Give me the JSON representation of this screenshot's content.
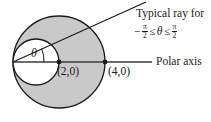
{
  "figure": {
    "colors": {
      "shaded_region": "#c9c9c9",
      "inner_region": "#ffffff",
      "stroke": "#1a1a1a",
      "background": "#ffffff"
    },
    "annotations": {
      "ray_caption": "Typical ray for",
      "range": {
        "minus": "−",
        "pi_numerator_left": "π",
        "two_denominator_left": "2",
        "relation_left": "≤",
        "theta": "θ",
        "relation_right": "≤",
        "pi_numerator_right": "π",
        "two_denominator_right": "2"
      },
      "polar_axis_label": "Polar axis",
      "theta_symbol": "θ",
      "point_a_label": "(2,0)",
      "point_b_label": "(4,0)"
    },
    "geometry": {
      "pole": {
        "x": 13,
        "y": 62
      },
      "outer_circle": {
        "cx": 59,
        "cy": 62,
        "r": 46
      },
      "inner_circle": {
        "cx": 36,
        "cy": 62,
        "r": 23
      },
      "point_a": {
        "x": 59,
        "y": 62
      },
      "point_b": {
        "x": 105,
        "y": 62
      },
      "axis_line": {
        "x1": 13,
        "y1": 62,
        "x2": 152,
        "y2": 62
      },
      "ray_line": {
        "x1": 13,
        "y1": 62,
        "x2": 146,
        "y2": 2
      },
      "polar_label_leader": {
        "x1": 140,
        "y1": 62,
        "x2": 152,
        "y2": 62
      }
    }
  }
}
